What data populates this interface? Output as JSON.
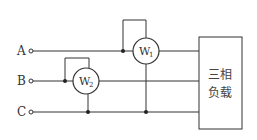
{
  "diagram": {
    "type": "circuit",
    "terminals": [
      {
        "id": "A",
        "label": "A"
      },
      {
        "id": "B",
        "label": "B"
      },
      {
        "id": "C",
        "label": "C"
      }
    ],
    "meters": [
      {
        "id": "W1",
        "base": "W",
        "sub": "1",
        "line": "A",
        "voltage_to": "C"
      },
      {
        "id": "W2",
        "base": "W",
        "sub": "2",
        "line": "B",
        "voltage_to": "C"
      }
    ],
    "load": {
      "line1": "三相",
      "line2": "负载"
    },
    "colors": {
      "wire": "#333333",
      "background": "#ffffff"
    }
  }
}
